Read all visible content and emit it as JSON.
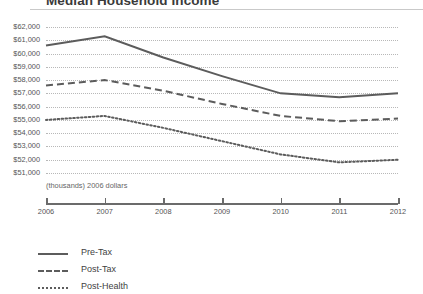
{
  "chart_data": {
    "type": "line",
    "title": "Median Household Income",
    "xlabel": "",
    "ylabel": "",
    "units_note": "(thousands) 2006 dollars",
    "x": [
      2006,
      2007,
      2008,
      2009,
      2010,
      2011,
      2012
    ],
    "xtick_labels": [
      "2006",
      "2007",
      "2008",
      "2009",
      "2010",
      "2011",
      "2012"
    ],
    "xlim": [
      2006,
      2012
    ],
    "ylim": [
      51000,
      62000
    ],
    "ytick_values": [
      62000,
      61000,
      60000,
      59000,
      58000,
      57000,
      56000,
      55000,
      54000,
      53000,
      52000,
      51000
    ],
    "ytick_labels": [
      "$62,000",
      "$61,000",
      "$60,000",
      "$59,000",
      "$58,000",
      "$57,000",
      "$56,000",
      "$55,000",
      "$54,000",
      "$53,000",
      "$52,000",
      "$51,000"
    ],
    "grid": "horizontal-dotted",
    "legend_position": "bottom-left",
    "series": [
      {
        "name": "Pre-Tax",
        "style": "solid",
        "color": "#5c5c5c",
        "values": [
          60600,
          61300,
          59700,
          58300,
          57000,
          56700,
          57000
        ]
      },
      {
        "name": "Post-Tax",
        "style": "dashed",
        "color": "#5c5c5c",
        "values": [
          57600,
          58000,
          57200,
          56200,
          55300,
          54900,
          55100
        ]
      },
      {
        "name": "Post-Health",
        "style": "dotted",
        "color": "#5c5c5c",
        "values": [
          55000,
          55300,
          54400,
          53400,
          52400,
          51800,
          52000
        ]
      }
    ]
  },
  "legend": {
    "items": [
      {
        "label": "Pre-Tax"
      },
      {
        "label": "Post-Tax"
      },
      {
        "label": "Post-Health"
      }
    ]
  }
}
